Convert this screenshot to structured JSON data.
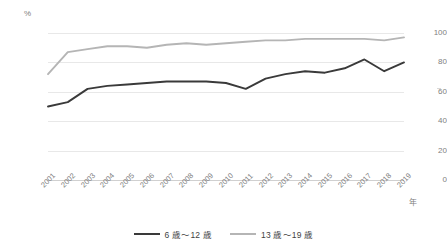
{
  "axes": {
    "y_unit": "%",
    "y_ticks": [
      "100",
      "80",
      "60",
      "40",
      "20",
      "0"
    ],
    "x_unit": "年"
  },
  "legend": {
    "items": [
      {
        "label": "6 歳～12 歳",
        "color": "#3a3a3a"
      },
      {
        "label": "13 歳～19 歳",
        "color": "#b5b5b5"
      }
    ]
  },
  "chart_data": {
    "type": "line",
    "title": "",
    "xlabel": "年",
    "ylabel": "%",
    "ylim": [
      0,
      100
    ],
    "ytick_values": [
      0,
      20,
      40,
      60,
      80,
      100
    ],
    "grid": true,
    "legend_position": "bottom",
    "categories": [
      "2001",
      "2002",
      "2003",
      "2004",
      "2005",
      "2006",
      "2007",
      "2008",
      "2009",
      "2010",
      "2011",
      "2012",
      "2013",
      "2014",
      "2015",
      "2016",
      "2017",
      "2018",
      "2019"
    ],
    "series": [
      {
        "name": "6 歳～12 歳",
        "color": "#3a3a3a",
        "values": [
          50,
          53,
          62,
          64,
          65,
          66,
          67,
          67,
          67,
          66,
          62,
          69,
          72,
          74,
          73,
          76,
          82,
          74,
          80
        ]
      },
      {
        "name": "13 歳～19 歳",
        "color": "#b5b5b5",
        "values": [
          72,
          87,
          89,
          91,
          91,
          90,
          92,
          93,
          92,
          93,
          94,
          95,
          95,
          96,
          96,
          96,
          96,
          95,
          97
        ]
      }
    ]
  }
}
